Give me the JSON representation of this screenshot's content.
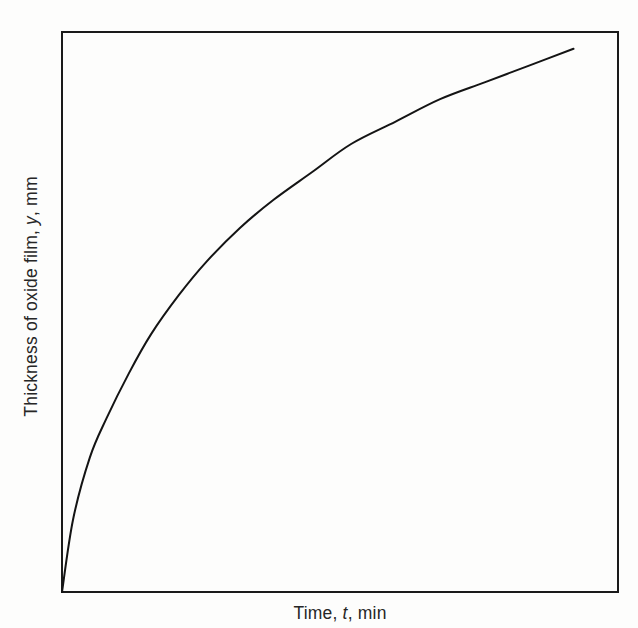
{
  "figure": {
    "background_color": "#fdfdfc",
    "frame_color": "#1a1a1a",
    "curve_color": "#141414"
  },
  "axis_labels": {
    "x_prefix": "Time, ",
    "x_variable": "t",
    "x_suffix": ", min",
    "x_full": "Time, t, min",
    "y_prefix": "Thickness of oxide film, ",
    "y_variable": "y",
    "y_suffix": ", mm",
    "y_full": "Thickness of oxide film, y, mm"
  },
  "chart_data": {
    "type": "line",
    "title": "",
    "subtitle": "",
    "xlabel": "Time, t, min",
    "ylabel": "Thickness of oxide film, y, mm",
    "xlim": [
      0,
      1
    ],
    "ylim": [
      0,
      1
    ],
    "grid": false,
    "legend": null,
    "axis_ticks": {
      "x": [],
      "y": [],
      "note": "Schematic plot - axes are unlabeled with no tick marks or gridlines"
    },
    "annotations": [],
    "series": [
      {
        "name": "oxide film growth",
        "color": "#141414",
        "line_width": 2,
        "x": [
          0.0,
          0.02,
          0.05,
          0.08,
          0.12,
          0.16,
          0.21,
          0.26,
          0.32,
          0.38,
          0.45,
          0.52,
          0.6,
          0.68,
          0.76,
          0.84,
          0.92
        ],
        "y": [
          0.0,
          0.13,
          0.24,
          0.31,
          0.39,
          0.46,
          0.53,
          0.59,
          0.65,
          0.7,
          0.75,
          0.8,
          0.84,
          0.88,
          0.91,
          0.94,
          0.97
        ]
      }
    ]
  }
}
